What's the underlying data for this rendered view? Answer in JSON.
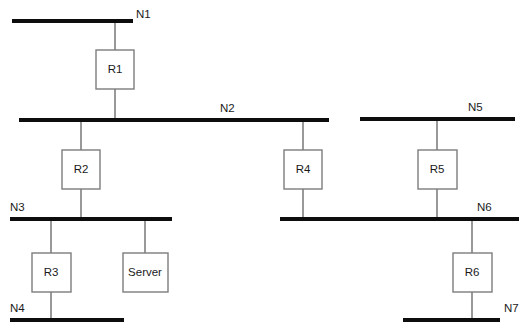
{
  "diagram": {
    "type": "network-topology",
    "colors": {
      "bus": "#0d0d0d",
      "drop": "#6e6e6e",
      "box_stroke": "#7d7d7d",
      "box_fill": "#ffffff",
      "text": "#1a1a1a",
      "background": "#ffffff"
    },
    "networks": [
      {
        "id": "n1",
        "label": "N1",
        "x1": 12,
        "x2": 133,
        "y": 21,
        "label_x": 136,
        "label_y": 18,
        "label_anchor": "start"
      },
      {
        "id": "n2",
        "label": "N2",
        "x1": 19,
        "x2": 329,
        "y": 120,
        "label_x": 220,
        "label_y": 112,
        "label_anchor": "start"
      },
      {
        "id": "n3",
        "label": "N3",
        "x1": 10,
        "x2": 172,
        "y": 219,
        "label_x": 10,
        "label_y": 211,
        "label_anchor": "start"
      },
      {
        "id": "n4",
        "label": "N4",
        "x1": 10,
        "x2": 124,
        "y": 320,
        "label_x": 10,
        "label_y": 312,
        "label_anchor": "start"
      },
      {
        "id": "n5",
        "label": "N5",
        "x1": 360,
        "x2": 515,
        "y": 119,
        "label_x": 468,
        "label_y": 111,
        "label_anchor": "start"
      },
      {
        "id": "n6",
        "label": "N6",
        "x1": 280,
        "x2": 519,
        "y": 219,
        "label_x": 477,
        "label_y": 211,
        "label_anchor": "start"
      },
      {
        "id": "n7",
        "label": "N7",
        "x1": 403,
        "x2": 500,
        "y": 320,
        "label_x": 504,
        "label_y": 312,
        "label_anchor": "start"
      }
    ],
    "devices": [
      {
        "id": "r1",
        "label": "R1",
        "x": 96,
        "y": 50,
        "w": 38,
        "h": 39,
        "cx": 115
      },
      {
        "id": "r2",
        "label": "R2",
        "x": 62,
        "y": 150,
        "w": 38,
        "h": 39,
        "cx": 81
      },
      {
        "id": "r3",
        "label": "R3",
        "x": 32,
        "y": 253,
        "w": 39,
        "h": 39,
        "cx": 51
      },
      {
        "id": "server",
        "label": "Server",
        "x": 123,
        "y": 253,
        "w": 45,
        "h": 39,
        "cx": 145
      },
      {
        "id": "r4",
        "label": "R4",
        "x": 284,
        "y": 150,
        "w": 38,
        "h": 39,
        "cx": 303
      },
      {
        "id": "r5",
        "label": "R5",
        "x": 418,
        "y": 150,
        "w": 39,
        "h": 39,
        "cx": 437
      },
      {
        "id": "r6",
        "label": "R6",
        "x": 453,
        "y": 253,
        "w": 39,
        "h": 39,
        "cx": 472
      }
    ],
    "links": [
      {
        "id": "n1-r1",
        "x": 115,
        "y1": 21,
        "y2": 50
      },
      {
        "id": "r1-n2",
        "x": 115,
        "y1": 89,
        "y2": 120
      },
      {
        "id": "n2-r2",
        "x": 81,
        "y1": 120,
        "y2": 150
      },
      {
        "id": "r2-n3",
        "x": 81,
        "y1": 189,
        "y2": 219
      },
      {
        "id": "n3-r3",
        "x": 51,
        "y1": 219,
        "y2": 253
      },
      {
        "id": "r3-n4",
        "x": 51,
        "y1": 292,
        "y2": 320
      },
      {
        "id": "n3-server",
        "x": 145,
        "y1": 219,
        "y2": 253
      },
      {
        "id": "n2-r4",
        "x": 303,
        "y1": 120,
        "y2": 150
      },
      {
        "id": "r4-n6",
        "x": 303,
        "y1": 189,
        "y2": 219
      },
      {
        "id": "n5-r5",
        "x": 437,
        "y1": 119,
        "y2": 150
      },
      {
        "id": "r5-n6",
        "x": 437,
        "y1": 189,
        "y2": 219
      },
      {
        "id": "n6-r6",
        "x": 472,
        "y1": 219,
        "y2": 253
      },
      {
        "id": "r6-n7",
        "x": 472,
        "y1": 292,
        "y2": 320
      }
    ]
  }
}
